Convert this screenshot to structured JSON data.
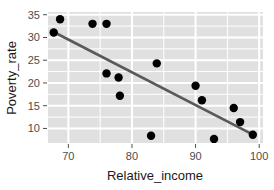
{
  "chart_data": {
    "type": "scatter",
    "title": "",
    "xlabel": "Relative_income",
    "ylabel": "Poverty_rate",
    "xlim": [
      66.8,
      100.6
    ],
    "ylim": [
      6.8,
      35.6
    ],
    "xticks": [
      70,
      80,
      90,
      100
    ],
    "xtick_labels": [
      "70",
      "80",
      "90",
      "100"
    ],
    "yticks": [
      10,
      15,
      20,
      25,
      30,
      35
    ],
    "ytick_labels": [
      "10",
      "15",
      "20",
      "25",
      "30",
      "35"
    ],
    "x_minor_ticks": [
      75,
      85,
      95
    ],
    "y_minor_ticks": [
      12.5,
      17.5,
      22.5,
      27.5,
      32.5
    ],
    "grid": true,
    "legend": "none",
    "panel_background": "#E0E0E0",
    "gridline_color": "#FFFFFF",
    "point_color": "#000000",
    "point_size": 4.2,
    "series": [
      {
        "name": "observations",
        "points": [
          {
            "x": 68.7,
            "y": 34.0
          },
          {
            "x": 67.7,
            "y": 31.1
          },
          {
            "x": 73.8,
            "y": 33.0
          },
          {
            "x": 76.0,
            "y": 33.0
          },
          {
            "x": 76.0,
            "y": 22.1
          },
          {
            "x": 77.9,
            "y": 21.2
          },
          {
            "x": 78.1,
            "y": 17.2
          },
          {
            "x": 83.9,
            "y": 24.3
          },
          {
            "x": 83.0,
            "y": 8.4
          },
          {
            "x": 90.0,
            "y": 19.4
          },
          {
            "x": 91.0,
            "y": 16.2
          },
          {
            "x": 92.9,
            "y": 7.7
          },
          {
            "x": 96.0,
            "y": 14.5
          },
          {
            "x": 97.0,
            "y": 11.4
          },
          {
            "x": 99.0,
            "y": 8.6
          }
        ]
      }
    ],
    "trendline": {
      "name": "fit-line",
      "color": "#595959",
      "width": 2.6,
      "x0": 67.7,
      "y0": 31.2,
      "x1": 99.1,
      "y1": 8.6
    }
  }
}
